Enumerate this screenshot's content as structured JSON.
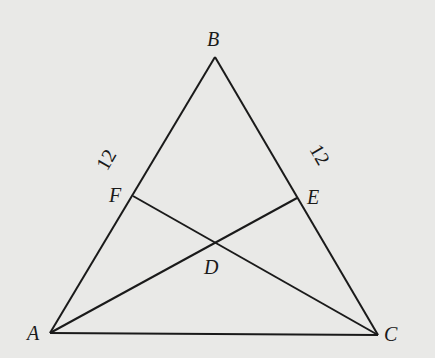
{
  "diagram": {
    "type": "triangle-geometry",
    "background": "#e9e9e7",
    "points": {
      "A": {
        "label": "A",
        "x": 50,
        "y": 333
      },
      "B": {
        "label": "B",
        "x": 215,
        "y": 57
      },
      "C": {
        "label": "C",
        "x": 378,
        "y": 335
      },
      "D": {
        "label": "D",
        "x": 214,
        "y": 242
      },
      "E": {
        "label": "E",
        "x": 297,
        "y": 198
      },
      "F": {
        "label": "F",
        "x": 133,
        "y": 196
      }
    },
    "segments": [
      "AB",
      "BC",
      "AC",
      "AE",
      "CF"
    ],
    "side_labels": {
      "BF": "12",
      "BE": "12"
    }
  }
}
